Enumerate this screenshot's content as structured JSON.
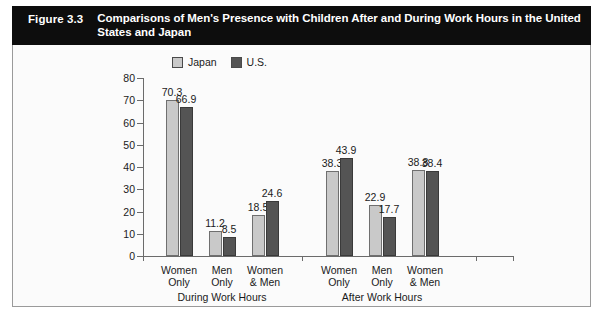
{
  "figure": {
    "number": "Figure 3.3",
    "title": "Comparisons of Men's Presence with Children After and During Work Hours in the United States and Japan"
  },
  "legend": {
    "position": "top-left-inside",
    "items": [
      {
        "label": "Japan",
        "color": "#c9c9c9"
      },
      {
        "label": "U.S.",
        "color": "#545454"
      }
    ]
  },
  "chart_data": {
    "type": "bar",
    "title": "Comparisons of Men's Presence with Children After and During Work Hours in the United States and Japan",
    "xlabel": "",
    "ylabel": "",
    "ylim": [
      0,
      80
    ],
    "yticks": [
      0,
      10,
      20,
      30,
      40,
      50,
      60,
      70,
      80
    ],
    "ytick_labels": [
      "0",
      "10",
      "20",
      "30",
      "40",
      "50",
      "60",
      "70",
      "80"
    ],
    "grid": false,
    "legend": [
      "Japan",
      "U.S."
    ],
    "legend_position": "upper left",
    "categories": [
      "Women Only",
      "Men Only",
      "Women & Men",
      "Women Only",
      "Men Only",
      "Women & Men"
    ],
    "category_lines": [
      [
        "Women",
        "Only"
      ],
      [
        "Men",
        "Only"
      ],
      [
        "Women",
        "& Men"
      ],
      [
        "Women",
        "Only"
      ],
      [
        "Men",
        "Only"
      ],
      [
        "Women",
        "& Men"
      ]
    ],
    "groups": [
      {
        "name": "During Work Hours",
        "categories": [
          0,
          1,
          2
        ]
      },
      {
        "name": "After Work Hours",
        "categories": [
          3,
          4,
          5
        ]
      }
    ],
    "series": [
      {
        "name": "Japan",
        "color": "#c9c9c9",
        "values": [
          70.3,
          11.2,
          18.5,
          38.3,
          22.9,
          38.8
        ]
      },
      {
        "name": "U.S.",
        "color": "#545454",
        "values": [
          66.9,
          8.5,
          24.6,
          43.9,
          17.7,
          38.4
        ]
      }
    ]
  }
}
